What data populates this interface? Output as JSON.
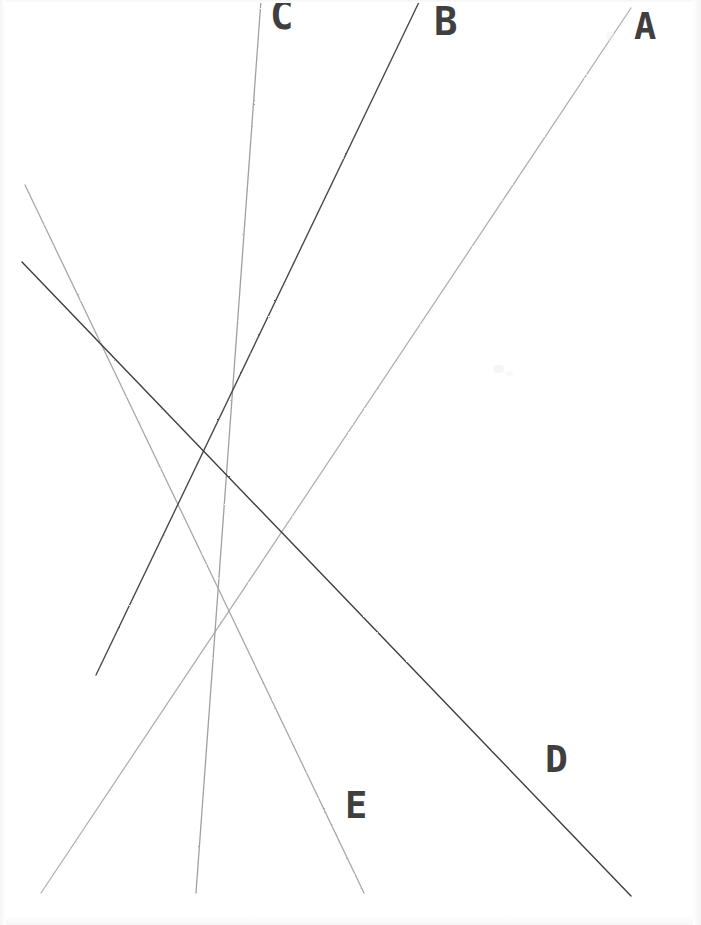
{
  "figure": {
    "kind": "hand-drawn-line-diagram",
    "background_color": "#ffffff",
    "width": 701,
    "height": 925
  },
  "axes": {
    "vertical": {
      "name": "vertical-axis",
      "x": 96,
      "y_top": 0,
      "y_bottom": 893,
      "color": "#2b2b2b",
      "width": 2.0
    },
    "horizontal": {
      "name": "horizontal-axis",
      "y": 847,
      "x_left": 28,
      "x_right": 691,
      "color": "#2b2b2b",
      "width": 2.0
    }
  },
  "curves": [
    {
      "id": "A",
      "label": "A",
      "direction": "upward-sloping",
      "color": "#b2b2b2",
      "width": 1.3,
      "x1": 41,
      "y1": 893,
      "x2": 631,
      "y2": 8,
      "label_x": 634,
      "label_y": 8
    },
    {
      "id": "B",
      "label": "B",
      "direction": "upward-sloping",
      "color": "#4a4a4a",
      "width": 1.4,
      "x1": 96,
      "y1": 675,
      "x2": 420,
      "y2": 0,
      "label_x": 434,
      "label_y": 2
    },
    {
      "id": "C",
      "label": "C",
      "direction": "upward-sloping",
      "color": "#a0a0a0",
      "width": 1.3,
      "x1": 196,
      "y1": 893,
      "x2": 261,
      "y2": 0,
      "label_x": 270,
      "label_y": -4
    },
    {
      "id": "D",
      "label": "D",
      "direction": "downward-sloping",
      "color": "#3d3d3d",
      "width": 1.4,
      "x1": 22,
      "y1": 262,
      "x2": 631,
      "y2": 896,
      "label_x": 545,
      "label_y": 740
    },
    {
      "id": "E",
      "label": "E",
      "direction": "downward-sloping",
      "color": "#a8a8a8",
      "width": 1.3,
      "x1": 25,
      "y1": 185,
      "x2": 364,
      "y2": 893,
      "label_x": 345,
      "label_y": 787
    }
  ],
  "intersections": [
    {
      "name": "upper-y-axis-crossing",
      "x": 96,
      "y": 331,
      "curves": [
        "D",
        "E"
      ]
    },
    {
      "name": "lower-y-axis-crossing",
      "x": 96,
      "y": 675,
      "curves": [
        "A",
        "B"
      ]
    },
    {
      "name": "D-A-crossing",
      "x": 345,
      "y": 595,
      "curves": [
        "D",
        "A"
      ]
    },
    {
      "name": "C-E-crossing",
      "x": 248,
      "y": 709,
      "curves": [
        "C",
        "E"
      ]
    }
  ],
  "labels": {
    "a": "A",
    "b": "B",
    "c": "C",
    "d": "D",
    "e": "E"
  },
  "chart_data": {
    "type": "line",
    "title": "",
    "xlabel": "",
    "ylabel": "",
    "grid": false,
    "legend": "inline-end-labels",
    "series": [
      {
        "name": "A",
        "slope_sign": "positive",
        "points": [
          [
            41,
            893
          ],
          [
            631,
            8
          ]
        ]
      },
      {
        "name": "B",
        "slope_sign": "positive",
        "points": [
          [
            96,
            675
          ],
          [
            420,
            0
          ]
        ]
      },
      {
        "name": "C",
        "slope_sign": "positive",
        "points": [
          [
            196,
            893
          ],
          [
            261,
            0
          ]
        ]
      },
      {
        "name": "D",
        "slope_sign": "negative",
        "points": [
          [
            22,
            262
          ],
          [
            631,
            896
          ]
        ]
      },
      {
        "name": "E",
        "slope_sign": "negative",
        "points": [
          [
            25,
            185
          ],
          [
            364,
            893
          ]
        ]
      }
    ]
  }
}
